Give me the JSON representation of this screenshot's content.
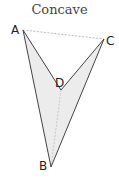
{
  "title": "Concave",
  "colors": {
    "fill": "#ececec",
    "edge": "#444444",
    "dashed": "#aaaaaa"
  },
  "vertices": {
    "A": {
      "label": "A",
      "x": 23,
      "y": 30
    },
    "B": {
      "label": "B",
      "x": 51,
      "y": 167
    },
    "C": {
      "label": "C",
      "x": 104,
      "y": 39
    },
    "D": {
      "label": "D",
      "x": 61,
      "y": 90
    }
  },
  "edges_solid": [
    "A-D",
    "D-C",
    "C-B",
    "B-A"
  ],
  "edges_dashed": [
    "A-C",
    "D-B"
  ]
}
